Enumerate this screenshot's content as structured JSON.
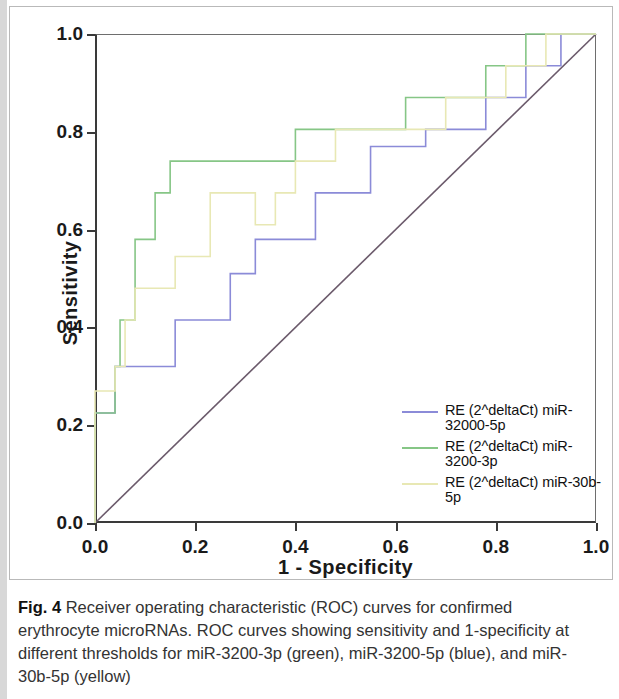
{
  "figure": {
    "caption_label": "Fig. 4",
    "caption_text": " Receiver operating characteristic (ROC) curves for confirmed erythrocyte microRNAs. ROC curves showing sensitivity and 1-specificity at different thresholds for miR-3200-3p (green), miR-3200-5p (blue), and miR-30b-5p (yellow)"
  },
  "legend": {
    "items": [
      {
        "label": "RE (2^deltaCt) miR-32000-5p",
        "color": "#8b8bd8",
        "series": "blue"
      },
      {
        "label": "RE (2^deltaCt) miR-3200-3p",
        "color": "#86c686",
        "series": "green"
      },
      {
        "label": "RE (2^deltaCt) miR-30b-5p",
        "color": "#e8e8b4",
        "series": "yellow"
      }
    ]
  },
  "chart_data": {
    "type": "line",
    "title": "",
    "xlabel": "1 - Specificity",
    "ylabel": "Sensitivity",
    "xlim": [
      0.0,
      1.0
    ],
    "ylim": [
      0.0,
      1.0
    ],
    "xticks": [
      "0.0",
      "0.2",
      "0.4",
      "0.6",
      "0.8",
      "1.0"
    ],
    "xtick_values": [
      0.0,
      0.2,
      0.4,
      0.6,
      0.8,
      1.0
    ],
    "yticks": [
      "0.0",
      "0.2",
      "0.4",
      "0.6",
      "0.8",
      "1.0"
    ],
    "ytick_values": [
      0.0,
      0.2,
      0.4,
      0.6,
      0.8,
      1.0
    ],
    "grid": false,
    "legend_position": "lower-right",
    "step_style": "post",
    "reference_line": {
      "name": "Reference Line",
      "color": "#6b5a6b",
      "points": [
        [
          0.0,
          0.0
        ],
        [
          1.0,
          1.0
        ]
      ]
    },
    "series": [
      {
        "name": "RE (2^deltaCt) miR-32000-5p",
        "short_name": "miR-3200-5p",
        "color": "#8b8bd8",
        "points": [
          [
            0.0,
            0.0
          ],
          [
            0.0,
            0.225
          ],
          [
            0.04,
            0.225
          ],
          [
            0.04,
            0.32
          ],
          [
            0.16,
            0.32
          ],
          [
            0.16,
            0.415
          ],
          [
            0.27,
            0.415
          ],
          [
            0.27,
            0.51
          ],
          [
            0.32,
            0.51
          ],
          [
            0.32,
            0.58
          ],
          [
            0.44,
            0.58
          ],
          [
            0.44,
            0.675
          ],
          [
            0.55,
            0.675
          ],
          [
            0.55,
            0.77
          ],
          [
            0.66,
            0.77
          ],
          [
            0.66,
            0.805
          ],
          [
            0.78,
            0.805
          ],
          [
            0.78,
            0.87
          ],
          [
            0.86,
            0.87
          ],
          [
            0.86,
            0.935
          ],
          [
            0.93,
            0.935
          ],
          [
            0.93,
            1.0
          ],
          [
            1.0,
            1.0
          ]
        ]
      },
      {
        "name": "RE (2^deltaCt) miR-3200-3p",
        "short_name": "miR-3200-3p",
        "color": "#86c686",
        "points": [
          [
            0.0,
            0.0
          ],
          [
            0.0,
            0.225
          ],
          [
            0.04,
            0.225
          ],
          [
            0.04,
            0.32
          ],
          [
            0.05,
            0.32
          ],
          [
            0.05,
            0.415
          ],
          [
            0.08,
            0.415
          ],
          [
            0.08,
            0.58
          ],
          [
            0.12,
            0.58
          ],
          [
            0.12,
            0.675
          ],
          [
            0.15,
            0.675
          ],
          [
            0.15,
            0.74
          ],
          [
            0.4,
            0.74
          ],
          [
            0.4,
            0.805
          ],
          [
            0.62,
            0.805
          ],
          [
            0.62,
            0.87
          ],
          [
            0.78,
            0.87
          ],
          [
            0.78,
            0.935
          ],
          [
            0.86,
            0.935
          ],
          [
            0.86,
            1.0
          ],
          [
            1.0,
            1.0
          ]
        ]
      },
      {
        "name": "RE (2^deltaCt) miR-30b-5p",
        "short_name": "miR-30b-5p",
        "color": "#e8e8b4",
        "points": [
          [
            0.0,
            0.0
          ],
          [
            0.0,
            0.27
          ],
          [
            0.04,
            0.27
          ],
          [
            0.04,
            0.32
          ],
          [
            0.06,
            0.32
          ],
          [
            0.06,
            0.415
          ],
          [
            0.08,
            0.415
          ],
          [
            0.08,
            0.48
          ],
          [
            0.16,
            0.48
          ],
          [
            0.16,
            0.545
          ],
          [
            0.23,
            0.545
          ],
          [
            0.23,
            0.675
          ],
          [
            0.32,
            0.675
          ],
          [
            0.32,
            0.61
          ],
          [
            0.36,
            0.61
          ],
          [
            0.36,
            0.675
          ],
          [
            0.4,
            0.675
          ],
          [
            0.4,
            0.74
          ],
          [
            0.48,
            0.74
          ],
          [
            0.48,
            0.805
          ],
          [
            0.7,
            0.805
          ],
          [
            0.7,
            0.87
          ],
          [
            0.82,
            0.87
          ],
          [
            0.82,
            0.935
          ],
          [
            0.9,
            0.935
          ],
          [
            0.9,
            1.0
          ],
          [
            1.0,
            1.0
          ]
        ]
      }
    ]
  }
}
